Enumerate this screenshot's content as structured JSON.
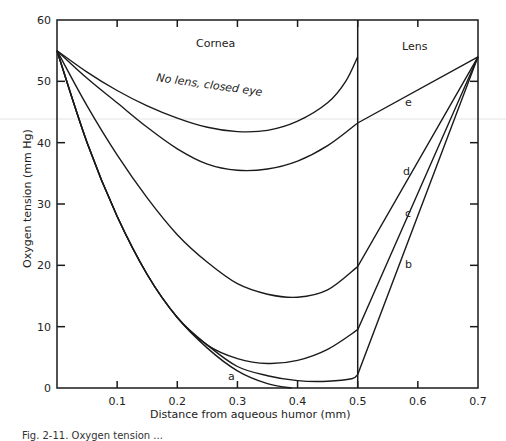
{
  "chart_data": {
    "type": "line",
    "title": "",
    "xlabel": "Distance from aqueous humor (mm)",
    "ylabel": "Oxygen tension (mm Hg)",
    "xlim": [
      0,
      0.7
    ],
    "ylim": [
      0,
      60
    ],
    "x_ticks": [
      "0.1",
      "0.2",
      "0.3",
      "0.4",
      "0.5",
      "0.6",
      "0.7"
    ],
    "y_ticks": [
      "0",
      "10",
      "20",
      "30",
      "40",
      "50",
      "60"
    ],
    "grid": false,
    "regions": [
      {
        "label": "Cornea",
        "x_range": [
          0,
          0.5
        ]
      },
      {
        "label": "Lens",
        "x_range": [
          0.5,
          0.7
        ]
      }
    ],
    "boundary_x": 0.5,
    "series": [
      {
        "name": "No lens, closed eye",
        "label": "No lens, closed eye",
        "x": [
          0,
          0.05,
          0.1,
          0.15,
          0.2,
          0.25,
          0.3,
          0.35,
          0.4,
          0.45,
          0.48,
          0.5
        ],
        "values": [
          55,
          51.5,
          48.5,
          46,
          44,
          42.5,
          41.8,
          42,
          43.5,
          46.5,
          50,
          54
        ]
      },
      {
        "name": "e",
        "label": "e",
        "x": [
          0,
          0.05,
          0.1,
          0.15,
          0.2,
          0.25,
          0.3,
          0.35,
          0.4,
          0.45,
          0.5,
          0.7
        ],
        "values": [
          55,
          50.5,
          46.5,
          42.5,
          39,
          36.5,
          35.5,
          35.7,
          37,
          39.5,
          43.2,
          54
        ]
      },
      {
        "name": "d",
        "label": "d",
        "x": [
          0,
          0.05,
          0.1,
          0.15,
          0.2,
          0.25,
          0.3,
          0.35,
          0.4,
          0.45,
          0.5,
          0.7
        ],
        "values": [
          55,
          46,
          38,
          31,
          25,
          20.5,
          17,
          15.3,
          14.8,
          16,
          19.8,
          54
        ]
      },
      {
        "name": "c",
        "label": "c",
        "x": [
          0,
          0.05,
          0.1,
          0.15,
          0.2,
          0.25,
          0.3,
          0.35,
          0.4,
          0.45,
          0.5,
          0.7
        ],
        "values": [
          55,
          40,
          28,
          18.5,
          11.5,
          7,
          4.8,
          4,
          4.5,
          6.3,
          9.5,
          54
        ]
      },
      {
        "name": "b",
        "label": "b",
        "x": [
          0,
          0.05,
          0.1,
          0.15,
          0.2,
          0.25,
          0.3,
          0.35,
          0.4,
          0.45,
          0.49,
          0.5,
          0.7
        ],
        "values": [
          55,
          40,
          28,
          18.5,
          11.5,
          7,
          3.5,
          2,
          1.2,
          1.1,
          1.5,
          2.2,
          54
        ]
      },
      {
        "name": "a",
        "label": "a",
        "x": [
          0,
          0.05,
          0.1,
          0.15,
          0.2,
          0.25,
          0.3,
          0.35,
          0.39
        ],
        "values": [
          55,
          40,
          28,
          18.5,
          11.5,
          6.5,
          2.8,
          0.7,
          0
        ]
      }
    ],
    "annotations": [
      {
        "text": "No lens, closed eye",
        "x": 0.13,
        "y": 45
      },
      {
        "text": "e",
        "x": 0.585,
        "y": 47.5
      },
      {
        "text": "d",
        "x": 0.575,
        "y": 37.5
      },
      {
        "text": "c",
        "x": 0.58,
        "y": 30.5
      },
      {
        "text": "b",
        "x": 0.58,
        "y": 23.5
      },
      {
        "text": "a",
        "x": 0.29,
        "y": 1.5
      }
    ]
  },
  "caption": "Fig. 2-11. Oxygen tension ..."
}
